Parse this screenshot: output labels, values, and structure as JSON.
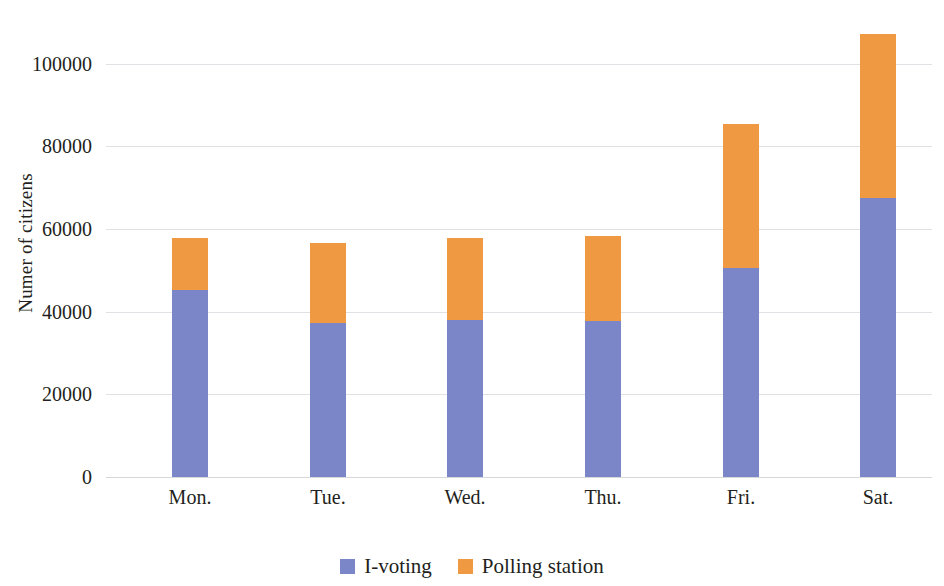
{
  "chart_data": {
    "type": "bar",
    "stacked": true,
    "title": "",
    "subtitle": "",
    "xlabel": "",
    "ylabel": "Numer of citizens",
    "categories": [
      "Mon.",
      "Tue.",
      "Wed.",
      "Thu.",
      "Fri.",
      "Sat."
    ],
    "series": [
      {
        "name": "I-voting",
        "color": "#7b86c8",
        "values": [
          45300,
          37200,
          37900,
          37700,
          50500,
          67500
        ]
      },
      {
        "name": "Polling station",
        "color": "#ef9a43",
        "values": [
          12500,
          19400,
          19900,
          20600,
          35000,
          39800
        ]
      }
    ],
    "totals": [
      57800,
      56600,
      57800,
      58300,
      85500,
      107300
    ],
    "ylim": [
      0,
      113000
    ],
    "yticks": [
      0,
      20000,
      40000,
      60000,
      80000,
      100000
    ],
    "ytick_labels": [
      "0",
      "20000",
      "40000",
      "60000",
      "80000",
      "100000"
    ],
    "grid": true,
    "grid_axis": "y",
    "legend_position": "bottom",
    "background_color": "#ffffff",
    "grid_color": "#d9dce0",
    "text_color": "#231f20"
  },
  "legend": {
    "items": [
      {
        "label": "I-voting",
        "color": "#7b86c8"
      },
      {
        "label": "Polling station",
        "color": "#ef9a43"
      }
    ]
  }
}
